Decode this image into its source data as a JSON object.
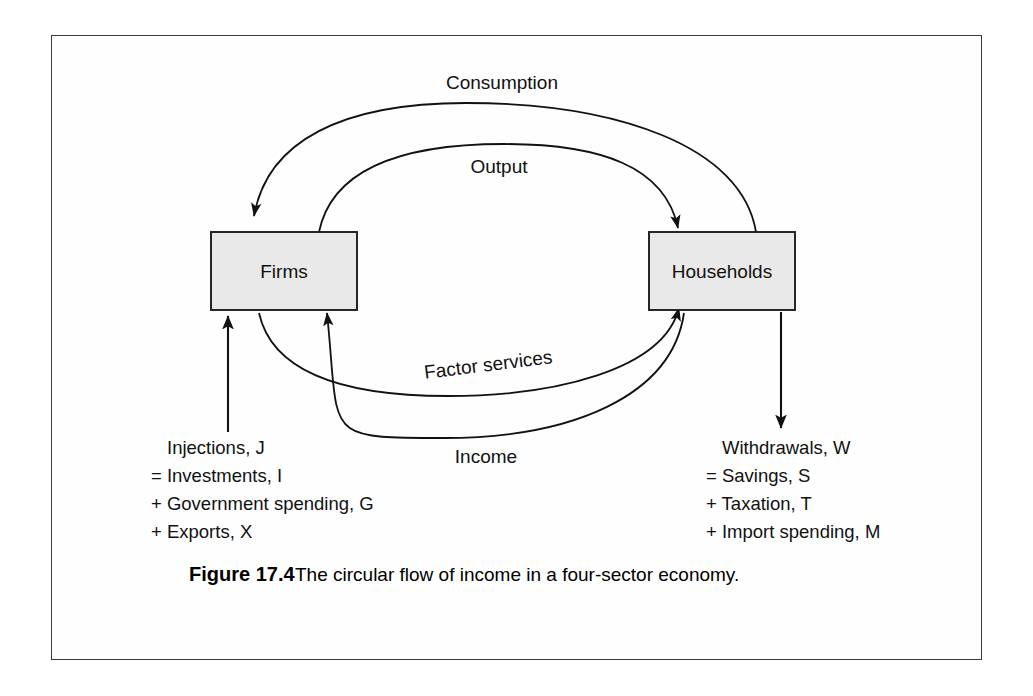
{
  "figure": {
    "caption_label": "Figure 17.4",
    "caption_text": "The circular flow of income in a four-sector economy."
  },
  "nodes": [
    {
      "id": "firms",
      "label": "Firms"
    },
    {
      "id": "households",
      "label": "Households"
    }
  ],
  "flows": [
    {
      "id": "consumption",
      "label": "Consumption",
      "from": "households",
      "to": "firms",
      "position": "outer-top"
    },
    {
      "id": "output",
      "label": "Output",
      "from": "firms",
      "to": "households",
      "position": "inner-top"
    },
    {
      "id": "factor-services",
      "label": "Factor services",
      "from": "firms",
      "to": "households",
      "position": "inner-bottom"
    },
    {
      "id": "income",
      "label": "Income",
      "from": "households",
      "to": "firms",
      "position": "outer-bottom"
    }
  ],
  "injections": {
    "title": "Injections, J",
    "lines": [
      "= Investments, I",
      "+ Government spending, G",
      "+ Exports, X"
    ]
  },
  "withdrawals": {
    "title": "Withdrawals, W",
    "lines": [
      "= Savings, S",
      "+ Taxation, T",
      "+ Import spending, M"
    ]
  },
  "colors": {
    "box_fill": "#e9e9e9",
    "stroke": "#111111",
    "frame": "#3a3a3a",
    "page_background": "#ffffff"
  }
}
